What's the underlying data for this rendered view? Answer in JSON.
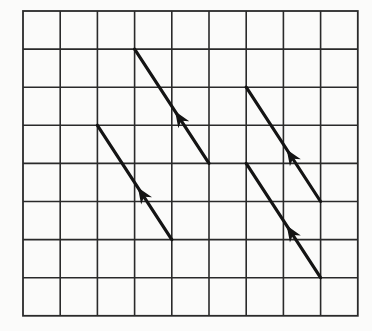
{
  "diagram": {
    "type": "vector-grid",
    "colors": {
      "background": "#fbfbfa",
      "grid": "#2a2a2a",
      "vector": "#141414"
    },
    "grid": {
      "columns": 9,
      "rows": 8,
      "origin_px": [
        23,
        11
      ],
      "cell_width_px": 37.2,
      "cell_height_px": 38.1
    },
    "vectors": [
      {
        "id": "v1",
        "from": [
          5,
          4
        ],
        "to": [
          3,
          1
        ],
        "displacement": [
          -2,
          -3
        ],
        "arrow": "midpoint"
      },
      {
        "id": "v2",
        "from": [
          4,
          6
        ],
        "to": [
          2,
          3
        ],
        "displacement": [
          -2,
          -3
        ],
        "arrow": "midpoint"
      },
      {
        "id": "v3",
        "from": [
          8,
          5
        ],
        "to": [
          6,
          2
        ],
        "displacement": [
          -2,
          -3
        ],
        "arrow": "midpoint"
      },
      {
        "id": "v4",
        "from": [
          8,
          7
        ],
        "to": [
          6,
          4
        ],
        "displacement": [
          -2,
          -3
        ],
        "arrow": "midpoint"
      }
    ]
  }
}
